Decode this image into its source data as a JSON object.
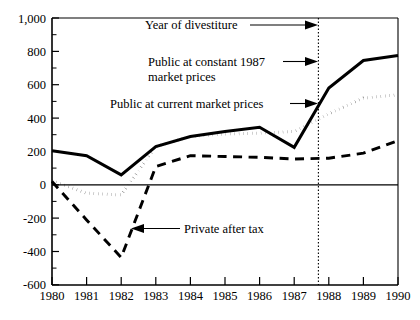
{
  "chart_data": {
    "type": "line",
    "title": "",
    "subtitle": "",
    "xlabel": "",
    "ylabel": "",
    "xlim": [
      1980,
      1990
    ],
    "ylim": [
      -600,
      1000
    ],
    "x": [
      1980,
      1981,
      1982,
      1983,
      1984,
      1985,
      1986,
      1987,
      1988,
      1989,
      1990
    ],
    "xticklabels": [
      "1980",
      "1981",
      "1982",
      "1983",
      "1984",
      "1985",
      "1986",
      "1987",
      "1988",
      "1989",
      "1990"
    ],
    "yticklabels": [
      "1,000",
      "800",
      "600",
      "400",
      "200",
      "0",
      "-200",
      "-400",
      "-600"
    ],
    "ytickvalues": [
      1000,
      800,
      600,
      400,
      200,
      0,
      -200,
      -400,
      -600
    ],
    "yminorstep": 100,
    "grid": false,
    "legend_position": "inline-annotations",
    "series": [
      {
        "name": "Public at constant 1987 market prices",
        "style": "solid",
        "values": [
          205,
          175,
          60,
          230,
          290,
          320,
          345,
          225,
          580,
          745,
          775
        ]
      },
      {
        "name": "Public at current market prices",
        "style": "dotted",
        "values": [
          25,
          -50,
          -60,
          230,
          290,
          305,
          310,
          320,
          425,
          520,
          540
        ]
      },
      {
        "name": "Private after tax",
        "style": "dashed",
        "values": [
          20,
          -210,
          -435,
          110,
          175,
          170,
          165,
          155,
          160,
          190,
          265
        ]
      }
    ],
    "annotations": [
      {
        "id": "year-of-divestiture",
        "text": "Year of divestiture",
        "arrow": "right",
        "target_x": 1987.7,
        "target_y": 940
      },
      {
        "id": "public-constant-1987",
        "text_line1": "Public at constant 1987",
        "text_line2": "market prices",
        "arrow": "right",
        "target_x": 1987.7,
        "target_y": 690
      },
      {
        "id": "public-current-market",
        "text": "Public at current market prices",
        "arrow": "right",
        "target_x": 1987.7,
        "target_y": 430
      },
      {
        "id": "private-after-tax",
        "text": "Private after tax",
        "arrow": "left",
        "target_x": 1982.35,
        "target_y": -290
      }
    ],
    "vline": {
      "id": "year-of-divestiture-line",
      "x": 1987.7,
      "style": "dotted"
    },
    "zero_line": true
  }
}
